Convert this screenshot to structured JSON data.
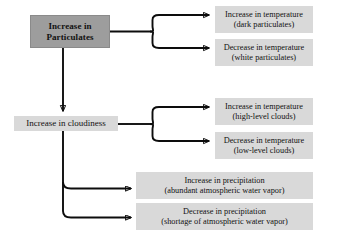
{
  "diagram": {
    "colors": {
      "source_box_fill": "#9d9d9d",
      "label_box_fill": "#d9d9d9",
      "line": "#0d0d0d",
      "text": "#111111",
      "background": "#ffffff"
    },
    "nodes": {
      "source": {
        "line1": "Increase in",
        "line2": "Particulates"
      },
      "cloudiness": {
        "label": "Increase in cloudiness"
      },
      "particulate_effects": [
        {
          "line1": "Increase in temperature",
          "line2": "(dark particulates)"
        },
        {
          "line1": "Decrease in temperature",
          "line2": "(white particulates)"
        }
      ],
      "cloud_temperature_effects": [
        {
          "line1": "Increase in temperature",
          "line2": "(high-level clouds)"
        },
        {
          "line1": "Decrease in temperature",
          "line2": "(low-level clouds)"
        }
      ],
      "precipitation_effects": [
        {
          "line1": "Increase in precipitation",
          "line2": "(abundant atmospheric water vapor)"
        },
        {
          "line1": "Decrease in precipitation",
          "line2": "(shortage of atmospheric water vapor)"
        }
      ]
    }
  }
}
